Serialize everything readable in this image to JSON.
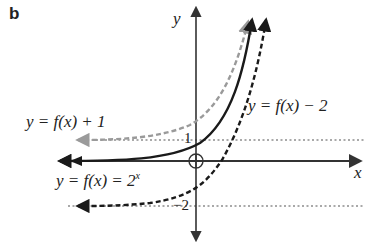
{
  "panel_label": "b",
  "axes": {
    "x_label": "x",
    "y_label": "y",
    "origin_marker": "circle-cross"
  },
  "tick_labels": {
    "y_pos_one": "1",
    "y_neg_two": "−2"
  },
  "curves": [
    {
      "name": "y = f(x) + 1",
      "label_prefix": "y = f(x) + 1",
      "style": "dashed",
      "color": "#9a9a9a",
      "asymptote": 1
    },
    {
      "name": "y = f(x) = 2^x",
      "label_prefix": "y = f(x) = 2",
      "label_exp": "x",
      "style": "solid",
      "color": "#1a1a1a",
      "asymptote": 0
    },
    {
      "name": "y = f(x) − 2",
      "label_prefix": "y = f(x) − 2",
      "style": "dashed",
      "color": "#1a1a1a",
      "asymptote": -2
    }
  ],
  "colors": {
    "axis": "#333333",
    "asymptote_dotted": "#555555",
    "gray_dashed": "#9a9a9a",
    "black": "#1a1a1a"
  }
}
